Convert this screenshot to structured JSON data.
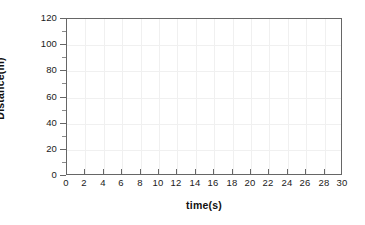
{
  "chart_data": {
    "type": "line",
    "title": "",
    "subtitle": "",
    "xlabel": "time(s)",
    "ylabel": "Distance(m)",
    "xlim": [
      0,
      30
    ],
    "ylim": [
      0,
      120
    ],
    "x_tick_labels": [
      "0",
      "2",
      "4",
      "6",
      "8",
      "10",
      "12",
      "14",
      "16",
      "18",
      "20",
      "22",
      "24",
      "26",
      "28",
      "30"
    ],
    "x_ticks": [
      0,
      2,
      4,
      6,
      8,
      10,
      12,
      14,
      16,
      18,
      20,
      22,
      24,
      26,
      28,
      30
    ],
    "y_tick_labels": [
      "0",
      "20",
      "40",
      "60",
      "80",
      "100",
      "120"
    ],
    "y_ticks": [
      0,
      20,
      40,
      60,
      80,
      100,
      120
    ],
    "x_tick_interval": 2,
    "y_tick_interval": 20,
    "grid": true,
    "grid_axes": "both",
    "grid_color": "#f0f0f0",
    "legend": false,
    "legend_position": "none",
    "series": [],
    "annotations": [],
    "frame_color": "#666666",
    "background_color": "#ffffff",
    "text_color": "#1a1a1a"
  },
  "figure": {
    "name": "blank-distance-time-graph",
    "axis_title_color": "#111111"
  }
}
